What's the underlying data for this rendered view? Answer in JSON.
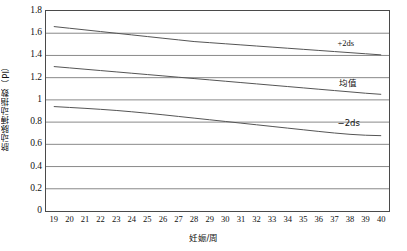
{
  "chart_data": {
    "type": "line",
    "title": "",
    "xlabel": "妊娠/周",
    "ylabel": "脐动脉搏动指数（PI）",
    "xlim": [
      18.5,
      40.5
    ],
    "ylim": [
      0,
      1.8
    ],
    "grid": "horizontal",
    "legend_position": "inline-right",
    "x": [
      19,
      20,
      21,
      22,
      23,
      24,
      25,
      26,
      27,
      28,
      29,
      30,
      31,
      32,
      33,
      34,
      35,
      36,
      37,
      38,
      39,
      40
    ],
    "xticks": [
      "19",
      "20",
      "21",
      "22",
      "23",
      "24",
      "25",
      "26",
      "27",
      "28",
      "29",
      "30",
      "31",
      "32",
      "33",
      "34",
      "35",
      "36",
      "37",
      "38",
      "39",
      "40"
    ],
    "yticks": [
      "0",
      "0.2",
      "0.4",
      "0.6",
      "0.8",
      "1",
      "1.2",
      "1.4",
      "1.6",
      "1.8"
    ],
    "ytick_values": [
      0,
      0.2,
      0.4,
      0.6,
      0.8,
      1.0,
      1.2,
      1.4,
      1.6,
      1.8
    ],
    "series": [
      {
        "name": "+2ds",
        "label": "+2ds",
        "color": "#555555",
        "values": [
          1.66,
          1.645,
          1.63,
          1.615,
          1.6,
          1.585,
          1.57,
          1.555,
          1.54,
          1.525,
          1.515,
          1.505,
          1.495,
          1.485,
          1.475,
          1.465,
          1.455,
          1.445,
          1.435,
          1.425,
          1.415,
          1.405
        ]
      },
      {
        "name": "mean",
        "label": "均值",
        "color": "#555555",
        "values": [
          1.3,
          1.288,
          1.276,
          1.264,
          1.252,
          1.24,
          1.228,
          1.216,
          1.204,
          1.192,
          1.18,
          1.168,
          1.156,
          1.144,
          1.132,
          1.12,
          1.108,
          1.096,
          1.084,
          1.072,
          1.06,
          1.05
        ]
      },
      {
        "name": "-2ds",
        "label": "−2ds",
        "color": "#555555",
        "values": [
          0.94,
          0.932,
          0.924,
          0.915,
          0.905,
          0.893,
          0.88,
          0.866,
          0.851,
          0.836,
          0.821,
          0.806,
          0.791,
          0.776,
          0.761,
          0.746,
          0.731,
          0.716,
          0.702,
          0.69,
          0.682,
          0.678
        ]
      }
    ],
    "annotations": [
      {
        "text": "+2ds",
        "x": 37.2,
        "y": 1.515
      },
      {
        "text": "均值",
        "x": 37.3,
        "y": 1.155
      },
      {
        "text": "−2ds",
        "x": 37.2,
        "y": 0.795
      }
    ]
  }
}
